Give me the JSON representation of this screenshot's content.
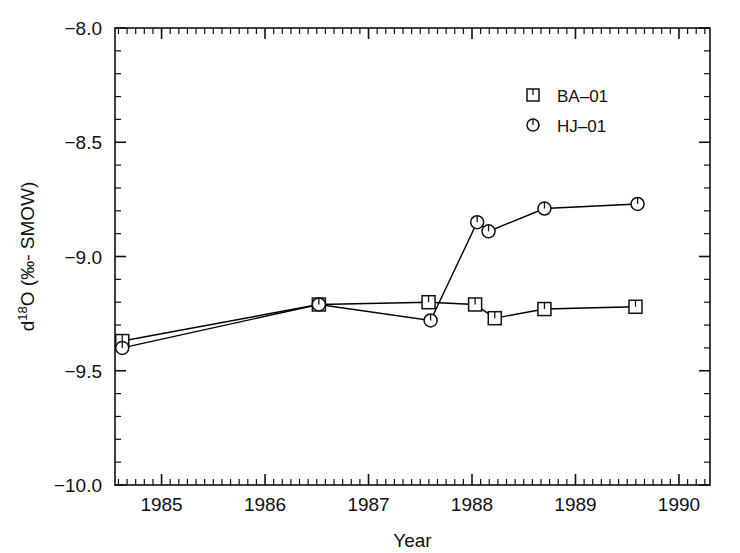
{
  "chart_data": {
    "type": "line",
    "title": "",
    "xlabel": "Year",
    "ylabel": "d18O (‰- SMOW)",
    "ylabel_parts": {
      "pre": "d",
      "sup": "18",
      "post": "O (‰- SMOW)"
    },
    "xlim": [
      1984.55,
      1990.3
    ],
    "ylim": [
      -10.0,
      -8.0
    ],
    "xticks": [
      1985,
      1986,
      1987,
      1988,
      1989,
      1990
    ],
    "xticklabels": [
      "1985",
      "1986",
      "1987",
      "1988",
      "1989",
      "1990"
    ],
    "yticks": [
      -8.0,
      -8.5,
      -9.0,
      -9.5,
      -10.0
    ],
    "yticklabels": [
      "−8.0",
      "−8.5",
      "−9.0",
      "−9.5",
      "−10.0"
    ],
    "y_minor_step": 0.1,
    "x_minor_step": 0.08333,
    "grid": false,
    "legend_position": "top-right",
    "series": [
      {
        "name": "BA-01",
        "marker": "square",
        "color": "#000000",
        "points": [
          {
            "x": 1984.62,
            "y": -9.37
          },
          {
            "x": 1986.52,
            "y": -9.21
          },
          {
            "x": 1987.58,
            "y": -9.2
          },
          {
            "x": 1988.03,
            "y": -9.21
          },
          {
            "x": 1988.22,
            "y": -9.27
          },
          {
            "x": 1988.7,
            "y": -9.23
          },
          {
            "x": 1989.58,
            "y": -9.22
          }
        ]
      },
      {
        "name": "HJ-01",
        "marker": "circle",
        "color": "#000000",
        "points": [
          {
            "x": 1984.62,
            "y": -9.4
          },
          {
            "x": 1986.52,
            "y": -9.21
          },
          {
            "x": 1987.6,
            "y": -9.28
          },
          {
            "x": 1988.05,
            "y": -8.85
          },
          {
            "x": 1988.16,
            "y": -8.89
          },
          {
            "x": 1988.7,
            "y": -8.79
          },
          {
            "x": 1989.6,
            "y": -8.77
          }
        ]
      }
    ]
  },
  "legend": {
    "items": [
      {
        "label": "BA-01",
        "marker": "square-tick-marker"
      },
      {
        "label": "HJ-01",
        "marker": "circle-tick-marker"
      }
    ]
  },
  "axes": {
    "x_title": "Year",
    "y_title_pre": "d",
    "y_title_sup": "18",
    "y_title_post": "O (‰- SMOW)"
  }
}
